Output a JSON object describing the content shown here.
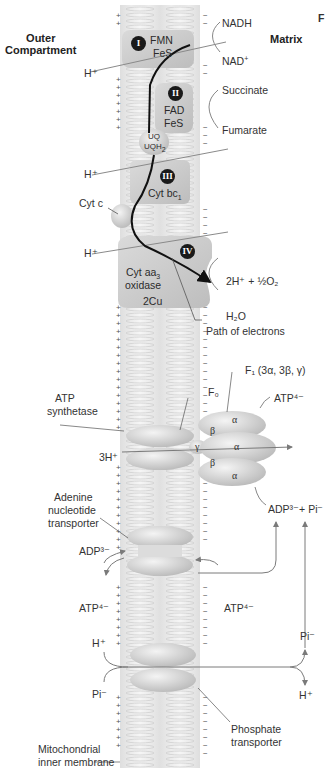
{
  "corner_partial_label": "F",
  "compartments": {
    "outer": "Outer\nCompartment",
    "matrix": "Matrix"
  },
  "complexes": [
    {
      "numeral": "I",
      "lines": [
        "FMN",
        "FeS"
      ]
    },
    {
      "numeral": "II",
      "lines": [
        "FAD",
        "FeS"
      ]
    },
    {
      "numeral": "III",
      "lines": [
        "Cyt bc",
        "1"
      ]
    },
    {
      "numeral": "IV",
      "lines": [
        "Cyt aa",
        "3",
        "oxidase",
        "2Cu"
      ]
    }
  ],
  "carriers": {
    "uq": "UQ",
    "uqh2": "UQH",
    "uqh2_sub": "2",
    "cyt_c": "Cyt c"
  },
  "substrates": {
    "nadh": "NADH",
    "nad": "NAD",
    "nad_sup": "+",
    "succinate": "Succinate",
    "fumarate": "Fumarate",
    "oxygen": "2H⁺ + ½O₂",
    "water": "H₂O",
    "path_of_electrons": "Path of electrons"
  },
  "protons": {
    "h_plus": "H⁺",
    "three_h_plus": "3H⁺"
  },
  "atp_synthetase": {
    "label_line1": "ATP",
    "label_line2": "synthetase",
    "f0": "F₀",
    "f1": "F₁ (3α, 3β, γ)",
    "atp_out": "ATP⁴⁻",
    "subunits": [
      "α",
      "β",
      "γ",
      "α",
      "β",
      "α"
    ]
  },
  "adenine_transporter": {
    "label": [
      "Adenine",
      "nucleotide",
      "transporter"
    ],
    "adp_in": "ADP³⁻",
    "atp_out_left": "ATP⁴⁻",
    "atp_in_right": "ATP⁴⁻",
    "adp_pi": "ADP³⁻+ Pi⁻"
  },
  "phosphate_transporter": {
    "label": [
      "Phosphate",
      "transporter"
    ],
    "h_left": "H⁺",
    "pi_left": "Pi⁻",
    "pi_right": "Pi⁻",
    "h_right": "H⁺"
  },
  "membrane": {
    "label": [
      "Mitochondrial",
      "inner membrane"
    ],
    "outer_charge": "+",
    "matrix_charge": "−"
  },
  "colors": {
    "complex_fill": "#c9c9c9",
    "membrane_fill": "#ececec",
    "electron_path": "#111111",
    "arrow": "#7a7a7a"
  }
}
